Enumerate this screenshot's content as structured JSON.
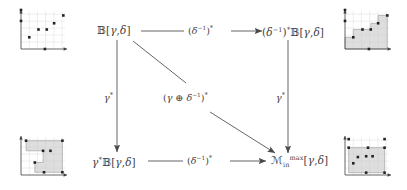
{
  "figure": {
    "type": "commutative-diagram",
    "background": "#ffffff",
    "ink": "#3f3f3f",
    "fill": "#c9c9c9"
  },
  "nodes": {
    "top_left": {
      "text": "\u0001",
      "parts": [
        "𝔹",
        "[",
        "γ",
        ",",
        "δ",
        "]"
      ],
      "label": "B[γ,δ]"
    },
    "top_right": {
      "label": "(δ⁻¹)*𝔹[γ,δ]"
    },
    "bottom_left": {
      "label": "γ*𝔹[γ,δ]"
    },
    "bottom_right": {
      "label": "𝓜ⱼₘₐₓ[γ,δ]"
    }
  },
  "labels": {
    "bb": "𝔹",
    "script_m": "ℳ",
    "gamma": "γ",
    "delta": "δ",
    "star": "*",
    "minus_one": "−1",
    "oplus": "⊕",
    "comma": ",",
    "lbrack": "[",
    "rbrack": "]",
    "lparen": "(",
    "rparen": ")",
    "sub_in": "in",
    "sup_max": "max"
  },
  "edges": {
    "top": {
      "label": "(δ⁻¹)*",
      "from": "top_left",
      "to": "top_right",
      "direction": "right"
    },
    "bottom": {
      "label": "(δ⁻¹)*",
      "from": "bottom_left",
      "to": "bottom_right",
      "direction": "right"
    },
    "left": {
      "label": "γ*",
      "from": "top_left",
      "to": "bottom_left",
      "direction": "down"
    },
    "right": {
      "label": "γ*",
      "from": "top_right",
      "to": "bottom_right",
      "direction": "down"
    },
    "diagonal": {
      "label": "(γ ⊕ δ⁻¹)*",
      "from": "top_left",
      "to": "bottom_right",
      "direction": "down-right"
    }
  },
  "chart_data": [
    {
      "id": "thumb-top-left",
      "type": "scatter",
      "title": "",
      "xlabel": "",
      "ylabel": "",
      "xlim": [
        0,
        5
      ],
      "ylim": [
        0,
        5
      ],
      "grid": true,
      "filled": false,
      "points": [
        {
          "x": 0,
          "y": 5
        },
        {
          "x": 0,
          "y": 3.6
        },
        {
          "x": 0.9,
          "y": 1.5
        },
        {
          "x": 1.9,
          "y": 2.5
        },
        {
          "x": 2.8,
          "y": 2.5
        },
        {
          "x": 3.6,
          "y": 3.3
        },
        {
          "x": 4.6,
          "y": 4.3
        },
        {
          "x": 2.6,
          "y": 0
        }
      ]
    },
    {
      "id": "thumb-top-right",
      "type": "area",
      "title": "",
      "xlabel": "",
      "ylabel": "",
      "xlim": [
        0,
        5
      ],
      "ylim": [
        0,
        5
      ],
      "grid": true,
      "filled": true,
      "fill_note": "staircase lower-set below the points",
      "points": [
        {
          "x": 0,
          "y": 5
        },
        {
          "x": 0,
          "y": 3.6
        },
        {
          "x": 0.9,
          "y": 1.5
        },
        {
          "x": 1.9,
          "y": 2.5
        },
        {
          "x": 2.8,
          "y": 2.5
        },
        {
          "x": 3.6,
          "y": 3.3
        },
        {
          "x": 4.6,
          "y": 4.3
        },
        {
          "x": 2.6,
          "y": 0
        }
      ],
      "staircase": [
        {
          "x": 0,
          "y": 1.5
        },
        {
          "x": 0.9,
          "y": 1.5
        },
        {
          "x": 0.9,
          "y": 2.5
        },
        {
          "x": 2.8,
          "y": 2.5
        },
        {
          "x": 2.8,
          "y": 3.3
        },
        {
          "x": 3.6,
          "y": 3.3
        },
        {
          "x": 3.6,
          "y": 4.3
        },
        {
          "x": 4.6,
          "y": 4.3
        }
      ]
    },
    {
      "id": "thumb-bottom-left",
      "type": "area",
      "title": "",
      "xlabel": "",
      "ylabel": "",
      "xlim": [
        0,
        5
      ],
      "ylim": [
        0,
        5
      ],
      "grid": true,
      "filled": true,
      "fill_note": "upper-set staircase region, notched",
      "points": [
        {
          "x": 0.55,
          "y": 4.4
        },
        {
          "x": 4.5,
          "y": 4.4
        },
        {
          "x": 2.4,
          "y": 3.1
        },
        {
          "x": 3.2,
          "y": 3.1
        },
        {
          "x": 1.5,
          "y": 1.6
        },
        {
          "x": 4.5,
          "y": 0.35
        },
        {
          "x": 2.5,
          "y": 0.35
        }
      ],
      "staircase": [
        {
          "x": 0.55,
          "y": 4.4
        },
        {
          "x": 0.55,
          "y": 3.1
        },
        {
          "x": 2.4,
          "y": 3.1
        },
        {
          "x": 2.4,
          "y": 1.6
        },
        {
          "x": 1.5,
          "y": 1.6
        },
        {
          "x": 1.5,
          "y": 0.35
        },
        {
          "x": 4.5,
          "y": 0.35
        }
      ]
    },
    {
      "id": "thumb-bottom-right",
      "type": "area",
      "title": "",
      "xlabel": "",
      "ylabel": "",
      "xlim": [
        0,
        5
      ],
      "ylim": [
        0,
        5
      ],
      "grid": true,
      "filled": true,
      "fill_note": "solid rectangular region under the top edge",
      "points": [
        {
          "x": 0.4,
          "y": 4.6
        },
        {
          "x": 0.4,
          "y": 3.5
        },
        {
          "x": 2.5,
          "y": 3.5
        },
        {
          "x": 4.3,
          "y": 3.5
        },
        {
          "x": 4.3,
          "y": 4.6
        },
        {
          "x": 1.4,
          "y": 2.3
        },
        {
          "x": 2.3,
          "y": 2.4
        },
        {
          "x": 3.0,
          "y": 2.4
        },
        {
          "x": 0.9,
          "y": 1.5
        },
        {
          "x": 2.3,
          "y": 0.3
        },
        {
          "x": 4.3,
          "y": 0.3
        }
      ]
    }
  ]
}
